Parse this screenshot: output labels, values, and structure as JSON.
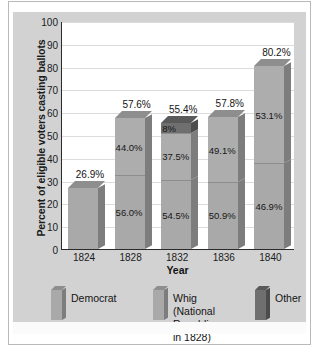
{
  "chart_data": {
    "type": "bar",
    "title": "",
    "subtitle": "",
    "xlabel": "Year",
    "ylabel": "Percent of eligible voters casting ballots",
    "categories": [
      "1824",
      "1828",
      "1832",
      "1836",
      "1840"
    ],
    "ylim": [
      0,
      100
    ],
    "yticks": [
      "0",
      "10",
      "20",
      "30",
      "40",
      "50",
      "60",
      "70",
      "80",
      "90",
      "100"
    ],
    "grid": true,
    "stacked": true,
    "legend_position": "bottom",
    "series": [
      {
        "name": "Democrat",
        "values": [
          26.9,
          56.0,
          54.5,
          50.9,
          46.9
        ]
      },
      {
        "name": "Whig (National Republican in 1828)",
        "values": [
          null,
          44.0,
          37.5,
          49.1,
          53.1
        ]
      },
      {
        "name": "Other",
        "values": [
          null,
          null,
          8.0,
          null,
          null
        ]
      }
    ],
    "totals": [
      26.9,
      57.6,
      55.4,
      57.8,
      80.2
    ],
    "total_labels": [
      "26.9%",
      "57.6%",
      "55.4%",
      "57.8%",
      "80.2%"
    ],
    "bars": [
      {
        "category": "1824",
        "total_label": "26.9%",
        "total_value": 26.9,
        "segments": [
          {
            "series": "Democrat",
            "label": "",
            "value": 26.9,
            "share_of_bar": 100
          }
        ]
      },
      {
        "category": "1828",
        "total_label": "57.6%",
        "total_value": 57.6,
        "segments": [
          {
            "series": "Democrat",
            "label": "56.0%",
            "value": 56.0,
            "share_of_bar": 56.0
          },
          {
            "series": "Whig (National Republican in 1828)",
            "label": "44.0%",
            "value": 44.0,
            "share_of_bar": 44.0
          }
        ]
      },
      {
        "category": "1832",
        "total_label": "55.4%",
        "total_value": 55.4,
        "segments": [
          {
            "series": "Democrat",
            "label": "54.5%",
            "value": 54.5,
            "share_of_bar": 54.5
          },
          {
            "series": "Whig (National Republican in 1828)",
            "label": "37.5%",
            "value": 37.5,
            "share_of_bar": 37.5
          },
          {
            "series": "Other",
            "label": "8%",
            "value": 8.0,
            "share_of_bar": 8.0
          }
        ]
      },
      {
        "category": "1836",
        "total_label": "57.8%",
        "total_value": 57.8,
        "segments": [
          {
            "series": "Democrat",
            "label": "50.9%",
            "value": 50.9,
            "share_of_bar": 50.9
          },
          {
            "series": "Whig (National Republican in 1828)",
            "label": "49.1%",
            "value": 49.1,
            "share_of_bar": 49.1
          }
        ]
      },
      {
        "category": "1840",
        "total_label": "80.2%",
        "total_value": 80.2,
        "segments": [
          {
            "series": "Democrat",
            "label": "46.9%",
            "value": 46.9,
            "share_of_bar": 46.9
          },
          {
            "series": "Whig (National Republican in 1828)",
            "label": "53.1%",
            "value": 53.1,
            "share_of_bar": 53.1
          }
        ]
      }
    ],
    "colors": {
      "democrat": "#a9a9a9",
      "whig": "#adadad",
      "other": "#6f6f6f",
      "panel": "#d2d2d2",
      "plot_background": "#ffffff",
      "gridline": "#dcdcdc",
      "axis": "#2b2b2b",
      "text": "#141414"
    }
  },
  "legend": {
    "items": [
      {
        "label": "Democrat",
        "key": "democrat"
      },
      {
        "label": "Whig (National\nRepublican in 1828)",
        "key": "whig"
      },
      {
        "label": "Other",
        "key": "other"
      }
    ]
  }
}
